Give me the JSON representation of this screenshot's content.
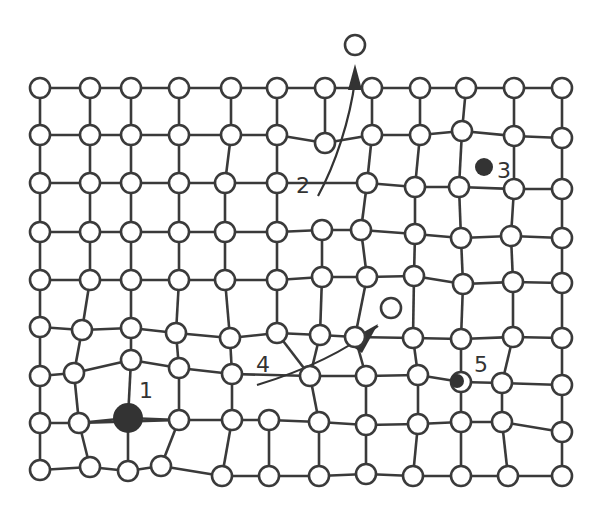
{
  "diagram": {
    "labels": [
      {
        "id": "1",
        "text": "1",
        "x": 139,
        "y": 398
      },
      {
        "id": "2",
        "text": "2",
        "x": 296,
        "y": 193
      },
      {
        "id": "3",
        "text": "3",
        "x": 497,
        "y": 178
      },
      {
        "id": "4",
        "text": "4",
        "x": 256,
        "y": 372
      },
      {
        "id": "5",
        "text": "5",
        "x": 474,
        "y": 372
      }
    ],
    "colors": {
      "stroke": "#3a3a3a",
      "fill": "#ffffff",
      "dark": "#333333"
    },
    "rows": [
      [
        [
          40,
          88
        ],
        [
          90,
          88
        ],
        [
          131,
          88
        ],
        [
          179,
          88
        ],
        [
          231,
          88
        ],
        [
          277,
          88
        ],
        [
          325,
          88
        ],
        [
          372,
          88
        ],
        [
          420,
          88
        ],
        [
          466,
          88
        ],
        [
          514,
          88
        ],
        [
          562,
          88
        ]
      ],
      [
        [
          40,
          135
        ],
        [
          90,
          135
        ],
        [
          131,
          135
        ],
        [
          179,
          135
        ],
        [
          231,
          135
        ],
        [
          277,
          135
        ],
        [
          325,
          143
        ],
        [
          372,
          135
        ],
        [
          420,
          135
        ],
        [
          462,
          131
        ],
        [
          514,
          136
        ],
        [
          562,
          138
        ]
      ],
      [
        [
          40,
          183
        ],
        [
          90,
          183
        ],
        [
          131,
          183
        ],
        [
          179,
          183
        ],
        [
          225,
          183
        ],
        [
          277,
          183
        ],
        [
          367,
          183
        ],
        [
          415,
          187
        ],
        [
          459,
          187
        ],
        [
          514,
          189
        ],
        [
          562,
          189
        ]
      ],
      [
        [
          40,
          232
        ],
        [
          90,
          232
        ],
        [
          131,
          232
        ],
        [
          179,
          232
        ],
        [
          225,
          232
        ],
        [
          277,
          232
        ],
        [
          322,
          230
        ],
        [
          361,
          230
        ],
        [
          415,
          234
        ],
        [
          461,
          238
        ],
        [
          511,
          236
        ],
        [
          562,
          238
        ]
      ],
      [
        [
          40,
          280
        ],
        [
          90,
          280
        ],
        [
          131,
          280
        ],
        [
          179,
          280
        ],
        [
          225,
          280
        ],
        [
          277,
          280
        ],
        [
          322,
          277
        ],
        [
          367,
          277
        ],
        [
          414,
          276
        ],
        [
          463,
          284
        ],
        [
          513,
          282
        ],
        [
          562,
          283
        ]
      ],
      [
        [
          40,
          327
        ],
        [
          82,
          330
        ],
        [
          131,
          328
        ],
        [
          176,
          333
        ],
        [
          230,
          338
        ],
        [
          277,
          333
        ],
        [
          320,
          335
        ],
        [
          355,
          337
        ],
        [
          413,
          338
        ],
        [
          461,
          339
        ],
        [
          513,
          337
        ],
        [
          562,
          338
        ]
      ],
      [
        [
          40,
          376
        ],
        [
          74,
          373
        ],
        [
          131,
          360
        ],
        [
          179,
          368
        ],
        [
          232,
          374
        ],
        [
          310,
          376
        ],
        [
          366,
          376
        ],
        [
          418,
          375
        ],
        [
          461,
          382
        ],
        [
          502,
          383
        ],
        [
          562,
          385
        ]
      ],
      [
        [
          40,
          423
        ],
        [
          79,
          423
        ],
        [
          179,
          420
        ],
        [
          232,
          420
        ],
        [
          269,
          420
        ],
        [
          319,
          422
        ],
        [
          366,
          425
        ],
        [
          418,
          424
        ],
        [
          461,
          422
        ],
        [
          502,
          422
        ],
        [
          562,
          432
        ]
      ],
      [
        [
          40,
          470
        ],
        [
          90,
          467
        ],
        [
          128,
          471
        ],
        [
          161,
          466
        ],
        [
          222,
          476
        ],
        [
          269,
          476
        ],
        [
          319,
          476
        ],
        [
          366,
          474
        ],
        [
          413,
          476
        ],
        [
          461,
          476
        ],
        [
          508,
          476
        ],
        [
          562,
          476
        ]
      ]
    ],
    "defects": {
      "interstitial_top": {
        "x": 355,
        "y": 45,
        "r": 10
      },
      "vacancy_open": {
        "x": 391,
        "y": 308,
        "r": 10
      },
      "large_substitutional": {
        "x": 128,
        "y": 418,
        "r": 15
      },
      "small_interstitial": {
        "x": 484,
        "y": 167,
        "r": 9
      },
      "small_substitutional": {
        "x": 457,
        "y": 381,
        "r": 7
      }
    }
  }
}
